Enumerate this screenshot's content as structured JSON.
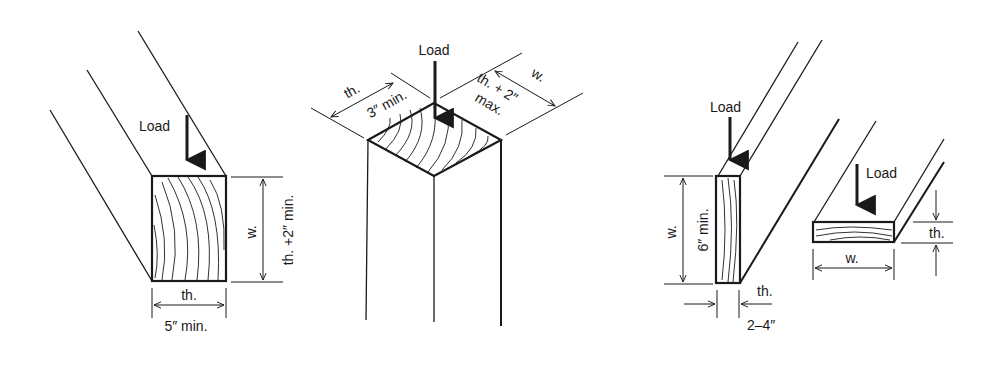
{
  "figure": {
    "ink_color": "#1a1a1a",
    "background": "#ffffff"
  },
  "left": {
    "load_label": "Load",
    "width_label": "w.",
    "width_spec": "th. +2″ min.",
    "thickness_label": "th.",
    "thickness_spec": "5″ min."
  },
  "center": {
    "load_label": "Load",
    "thickness_label": "th.",
    "thickness_spec": "3″ min.",
    "width_label": "w.",
    "width_spec_line1": "th. + 2″",
    "width_spec_line2": "max."
  },
  "right_edge": {
    "load_label": "Load",
    "width_label": "w.",
    "width_spec": "6″ min.",
    "thickness_label": "th.",
    "thickness_spec": "2–4″"
  },
  "right_flat": {
    "load_label": "Load",
    "thickness_label": "th.",
    "width_label": "w."
  }
}
